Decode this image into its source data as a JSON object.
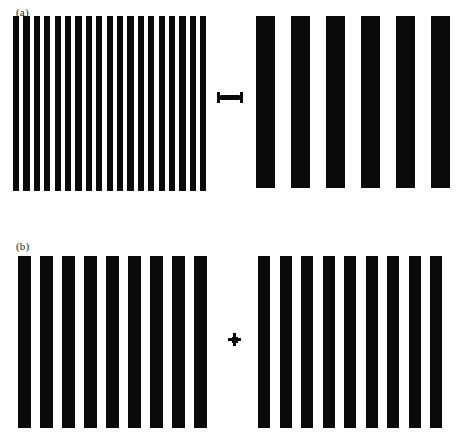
{
  "figure": {
    "background_color": "#ffffff",
    "bar_color": "#0a0a0a",
    "width": 460,
    "height": 440
  },
  "panels": [
    {
      "id": "a",
      "label": "(a)",
      "label_x": 16,
      "label_y": 6,
      "fixation": {
        "type": "dumbbell-marker",
        "x": 217,
        "y": 92,
        "width": 26,
        "height": 11
      },
      "gratings": [
        {
          "side": "left",
          "name": "high-spatial-frequency-grating",
          "x": 13,
          "y": 16,
          "width": 197,
          "height": 175,
          "bar_count": 19,
          "bar_width": 6.2,
          "period": 10.4
        },
        {
          "side": "right",
          "name": "low-spatial-frequency-grating",
          "x": 256,
          "y": 16,
          "width": 193,
          "height": 172,
          "bar_count": 6,
          "bar_width": 19,
          "period": 35.0
        }
      ]
    },
    {
      "id": "b",
      "label": "(b)",
      "label_x": 16,
      "label_y": 240,
      "fixation": {
        "type": "cross-marker",
        "x": 228,
        "y": 333,
        "width": 13,
        "height": 13
      },
      "gratings": [
        {
          "side": "left",
          "name": "medium-spatial-frequency-grating-left",
          "x": 18,
          "y": 256,
          "width": 190,
          "height": 172,
          "bar_count": 9,
          "bar_width": 13,
          "period": 22.0
        },
        {
          "side": "right",
          "name": "medium-spatial-frequency-grating-right",
          "x": 258,
          "y": 256,
          "width": 190,
          "height": 172,
          "bar_count": 9,
          "bar_width": 12,
          "period": 21.5
        }
      ]
    }
  ]
}
